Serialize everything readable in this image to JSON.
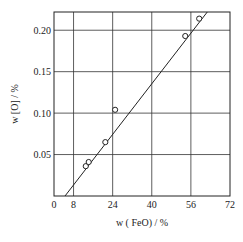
{
  "chart_data": {
    "type": "scatter",
    "title": "",
    "xlabel": "w ( FeO)  / %",
    "ylabel": "w [O] / %",
    "xlim": [
      0,
      72
    ],
    "ylim": [
      0,
      0.222
    ],
    "grid": true,
    "x_ticks": [
      "0",
      "8",
      "24",
      "40",
      "56",
      "72"
    ],
    "x_tick_values": [
      0,
      8,
      24,
      40,
      56,
      72
    ],
    "y_ticks": [
      "0.05",
      "0.10",
      "0.15",
      "0.20"
    ],
    "y_tick_values": [
      0.05,
      0.1,
      0.15,
      0.2
    ],
    "series": [
      {
        "name": "measured",
        "marker": "open-circle",
        "points": [
          {
            "x": 13.0,
            "y": 0.036
          },
          {
            "x": 14.2,
            "y": 0.041
          },
          {
            "x": 21.0,
            "y": 0.065
          },
          {
            "x": 25.0,
            "y": 0.104
          },
          {
            "x": 53.7,
            "y": 0.193
          },
          {
            "x": 59.4,
            "y": 0.214
          }
        ]
      },
      {
        "name": "fit",
        "type": "line",
        "points": [
          {
            "x": 4.5,
            "y": 0.0
          },
          {
            "x": 62.7,
            "y": 0.222
          }
        ]
      }
    ]
  }
}
